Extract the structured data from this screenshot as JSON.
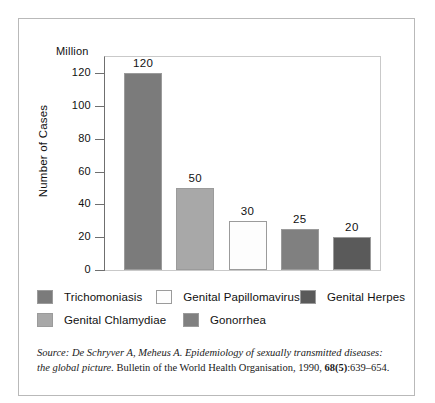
{
  "chart_data": {
    "type": "bar",
    "title": "",
    "unit_label": "Million",
    "ylabel": "Number of Cases",
    "xlabel": "",
    "ylim": [
      0,
      130
    ],
    "yticks": [
      0,
      20,
      40,
      60,
      80,
      100,
      120
    ],
    "ytick_labels": [
      "0",
      "20",
      "40",
      "60",
      "80",
      "100",
      "120"
    ],
    "grid": false,
    "legend_position": "below",
    "categories": [
      "Trichomoniasis",
      "Genital Chlamydiae",
      "Genital Papillomavirus",
      "Gonorrhea",
      "Genital Herpes"
    ],
    "values": [
      120,
      50,
      30,
      25,
      20
    ],
    "data_labels": [
      "120",
      "50",
      "30",
      "25",
      "20"
    ],
    "bar_colors": [
      "#7b7b7b",
      "#a8a8a8",
      "#fdfdfd",
      "#808080",
      "#5a5a5a"
    ]
  },
  "legend": {
    "rows": [
      [
        {
          "label": "Trichomoniasis",
          "color": "#7b7b7b"
        },
        {
          "label": "Genital Papillomavirus",
          "color": "#fdfdfd"
        },
        {
          "label": "Genital Herpes",
          "color": "#5a5a5a"
        }
      ],
      [
        {
          "label": "Genital Chlamydiae",
          "color": "#a8a8a8"
        },
        {
          "label": "Gonorrhea",
          "color": "#808080"
        }
      ]
    ]
  },
  "source": {
    "part1": "Source: De Schryver A, Meheus A. Epidemiology of sexually transmitted diseases: the global picture. ",
    "part2": "Bulletin of the World Health Organisation",
    "part3": ", 1990, ",
    "volume": "68(5)",
    "part4": ":639–654."
  }
}
